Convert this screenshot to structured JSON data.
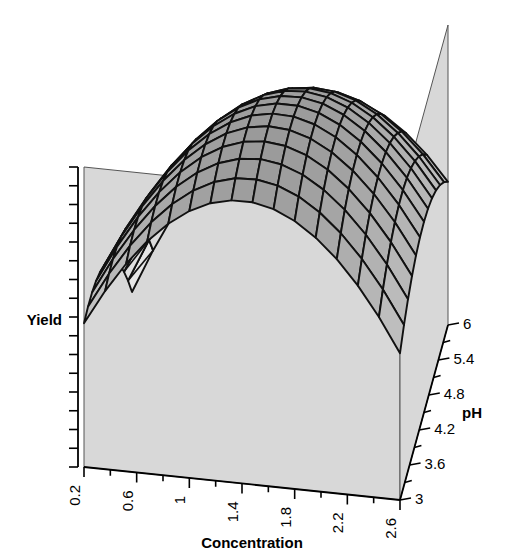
{
  "figure": {
    "kind": "3d-surface-response-plot",
    "background": "#ffffff",
    "wall_color": "#d8d8d8",
    "wall_edge_color": "#555555",
    "mesh_line_color": "#111111",
    "surface_dark": "#9a9a9a",
    "surface_mid": "#c4c4c4",
    "surface_light": "#f2f2f2"
  },
  "axes": {
    "x": {
      "name": "concentration-axis",
      "label": "Concentration",
      "ticks": [
        "0.2",
        "0.6",
        "1",
        "1.4",
        "1.8",
        "2.2",
        "2.6"
      ],
      "minor_ticks_between": 1,
      "min": 0.2,
      "max": 2.8
    },
    "y": {
      "name": "ph-axis",
      "label": "pH",
      "ticks": [
        "3",
        "3.6",
        "4.2",
        "4.8",
        "5.4",
        "6"
      ],
      "minor_ticks_between": 1,
      "min": 3,
      "max": 6
    },
    "z": {
      "name": "yield-axis",
      "label": "Yield",
      "ticks": [],
      "tick_count": 16
    }
  },
  "chart_data": {
    "type": "surface",
    "title": "",
    "xlabel": "Concentration",
    "ylabel": "pH",
    "zlabel": "Yield",
    "xlim": [
      0.2,
      2.8
    ],
    "ylim": [
      3,
      6
    ],
    "grid": false,
    "legend": "none",
    "x": [
      0.2,
      0.4,
      0.6,
      0.8,
      1.0,
      1.2,
      1.4,
      1.6,
      1.8,
      2.0,
      2.2,
      2.4,
      2.6,
      2.8
    ],
    "y": [
      3.0,
      3.3,
      3.6,
      3.9,
      4.2,
      4.5,
      4.8,
      5.1,
      5.4,
      5.7,
      6.0
    ],
    "z_model": {
      "description": "Quadratic response surface in Concentration (x) and pH (y); ridge rising toward high pH, falling sharply at high concentration and low pH.",
      "formula": "z = -0.62 + 0.80*x + 0.55*y - 0.34*x*x - 0.085*y*y + 0.075*x*y",
      "zmin": 0,
      "zmax": 1
    },
    "series": [
      {
        "name": "pH=3.0",
        "values": [
          0.02,
          0.1,
          0.17,
          0.22,
          0.26,
          0.28,
          0.29,
          0.28,
          0.25,
          0.21,
          0.15,
          0.08,
          0.0,
          -0.1
        ]
      },
      {
        "name": "pH=3.6",
        "values": [
          0.13,
          0.22,
          0.3,
          0.36,
          0.4,
          0.43,
          0.45,
          0.44,
          0.42,
          0.39,
          0.33,
          0.27,
          0.19,
          0.09
        ]
      },
      {
        "name": "pH=4.2",
        "values": [
          0.22,
          0.31,
          0.4,
          0.47,
          0.52,
          0.56,
          0.58,
          0.58,
          0.57,
          0.54,
          0.49,
          0.43,
          0.36,
          0.27
        ]
      },
      {
        "name": "pH=4.8",
        "values": [
          0.27,
          0.38,
          0.47,
          0.55,
          0.61,
          0.65,
          0.68,
          0.69,
          0.68,
          0.66,
          0.62,
          0.56,
          0.49,
          0.41
        ]
      },
      {
        "name": "pH=5.4",
        "values": [
          0.3,
          0.41,
          0.51,
          0.6,
          0.67,
          0.72,
          0.75,
          0.77,
          0.77,
          0.75,
          0.72,
          0.67,
          0.6,
          0.52
        ]
      },
      {
        "name": "pH=6.0",
        "values": [
          0.3,
          0.42,
          0.53,
          0.62,
          0.7,
          0.76,
          0.8,
          0.82,
          0.83,
          0.82,
          0.79,
          0.75,
          0.69,
          0.61
        ]
      }
    ]
  },
  "view": {
    "origin_px": [
      84,
      467
    ],
    "x_far_px": [
      400,
      500
    ],
    "y_far_px": [
      448,
      325
    ],
    "back_corner_px": [
      138,
      295
    ],
    "z_height_px": 300
  }
}
